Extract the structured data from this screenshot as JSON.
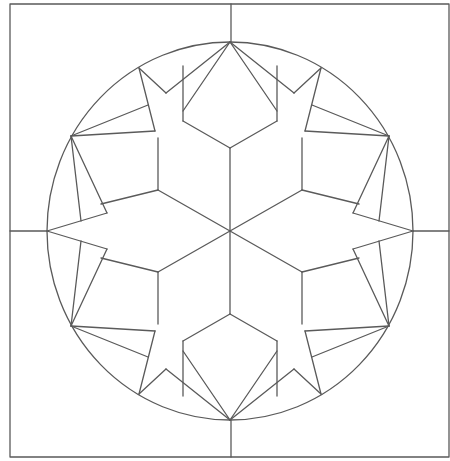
{
  "diagram": {
    "canvas": {
      "width": 450,
      "height": 461
    },
    "stroke_color": "#5a5a5a",
    "frame": {
      "x": 10,
      "y": 4,
      "width": 439,
      "height": 453
    },
    "center": {
      "x": 230,
      "y": 231
    },
    "circle": {
      "rx": 183,
      "ry": 189
    },
    "cross_lines": [
      {
        "x1": 231,
        "y1": 4,
        "x2": 231,
        "y2": 42
      },
      {
        "x1": 231,
        "y1": 420,
        "x2": 231,
        "y2": 457
      },
      {
        "x1": 10,
        "y1": 231,
        "x2": 47,
        "y2": 231
      },
      {
        "x1": 413,
        "y1": 231,
        "x2": 449,
        "y2": 231
      }
    ],
    "star_lines": [
      [
        230,
        231,
        230,
        148
      ],
      [
        230,
        148,
        183,
        121
      ],
      [
        230,
        148,
        277,
        121
      ],
      [
        183,
        121,
        183,
        66
      ],
      [
        277,
        121,
        277,
        66
      ],
      [
        230,
        231,
        158,
        190
      ],
      [
        158,
        190,
        101,
        204
      ],
      [
        158,
        190,
        158,
        138
      ],
      [
        230,
        231,
        302,
        190
      ],
      [
        302,
        190,
        359,
        204
      ],
      [
        302,
        190,
        302,
        138
      ],
      [
        230,
        231,
        158,
        272
      ],
      [
        158,
        272,
        101,
        258
      ],
      [
        158,
        272,
        158,
        324
      ],
      [
        230,
        231,
        302,
        272
      ],
      [
        302,
        272,
        359,
        258
      ],
      [
        302,
        272,
        302,
        324
      ],
      [
        230,
        231,
        230,
        314
      ],
      [
        230,
        314,
        183,
        341
      ],
      [
        230,
        314,
        277,
        341
      ],
      [
        183,
        341,
        183,
        396
      ],
      [
        277,
        341,
        277,
        396
      ],
      [
        230,
        42,
        183,
        111
      ],
      [
        230,
        42,
        166,
        93
      ],
      [
        230,
        42,
        277,
        111
      ],
      [
        230,
        42,
        294,
        93
      ],
      [
        139,
        68,
        155,
        131
      ],
      [
        155,
        131,
        71,
        136
      ],
      [
        71,
        136,
        148,
        105
      ],
      [
        321,
        68,
        305,
        131
      ],
      [
        305,
        131,
        389,
        136
      ],
      [
        389,
        136,
        312,
        105
      ],
      [
        71,
        136,
        81,
        221
      ],
      [
        71,
        136,
        107,
        213
      ],
      [
        107,
        213,
        47,
        231
      ],
      [
        389,
        136,
        379,
        221
      ],
      [
        389,
        136,
        353,
        213
      ],
      [
        353,
        213,
        413,
        231
      ],
      [
        47,
        231,
        107,
        249
      ],
      [
        107,
        249,
        71,
        326
      ],
      [
        71,
        326,
        81,
        241
      ],
      [
        413,
        231,
        353,
        249
      ],
      [
        353,
        249,
        389,
        326
      ],
      [
        389,
        326,
        379,
        241
      ],
      [
        71,
        326,
        155,
        331
      ],
      [
        155,
        331,
        139,
        394
      ],
      [
        148,
        357,
        71,
        326
      ],
      [
        389,
        326,
        305,
        331
      ],
      [
        305,
        331,
        321,
        394
      ],
      [
        312,
        357,
        389,
        326
      ],
      [
        230,
        420,
        183,
        351
      ],
      [
        230,
        420,
        166,
        369
      ],
      [
        230,
        420,
        277,
        351
      ],
      [
        230,
        420,
        294,
        369
      ],
      [
        139,
        394,
        166,
        369
      ],
      [
        321,
        394,
        294,
        369
      ],
      [
        139,
        68,
        166,
        93
      ],
      [
        321,
        68,
        294,
        93
      ]
    ]
  }
}
